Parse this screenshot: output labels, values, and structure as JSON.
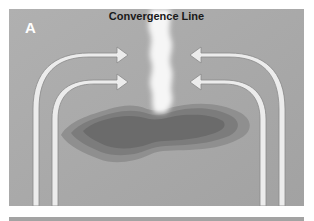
{
  "figure": {
    "panel_label": "A",
    "title": "Convergence Line",
    "colors": {
      "background": "#a9a9a9",
      "arrow_fill": "#ececec",
      "arrow_stroke": "#8a8a8a",
      "cloud": "#f4f4f4",
      "blob_outer": "#8e8e8e",
      "blob_middle": "#7a7a7a",
      "blob_inner": "#6a6a6a"
    },
    "elements": [
      {
        "type": "arrow",
        "direction": "right",
        "position": "upper-left"
      },
      {
        "type": "arrow",
        "direction": "right",
        "position": "lower-left"
      },
      {
        "type": "arrow",
        "direction": "left",
        "position": "upper-right"
      },
      {
        "type": "arrow",
        "direction": "left",
        "position": "lower-right"
      },
      {
        "type": "cloud-plume",
        "position": "center"
      },
      {
        "type": "precipitation-blob",
        "layers": 3,
        "position": "center"
      }
    ]
  }
}
